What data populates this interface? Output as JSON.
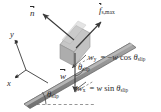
{
  "figure": {
    "name": "inclined-plane-free-body-diagram",
    "type": "physics-force-diagram",
    "background": "#ffffff"
  },
  "colors": {
    "stroke": "#3a3a3a",
    "plank_fill": "#8d8d8d",
    "plank_edge": "#6a6a6a",
    "block_fill": "#b3b3b3",
    "block_top": "#c9c9c9",
    "block_side": "#9a9a9a",
    "dashed": "#7a7a7a",
    "text": "#2b2b2b"
  },
  "labels": {
    "normal_force": {
      "symbol": "n",
      "vector": true,
      "text": "n"
    },
    "static_friction": {
      "symbol": "f",
      "sub": "s,max",
      "vector": true,
      "text": "fs,max"
    },
    "weight": {
      "symbol": "w",
      "vector": true,
      "text": "w"
    },
    "axis_y": "y",
    "axis_x": "x",
    "theta_block": "θslip",
    "theta_incline": "θslip",
    "w_y_equation": {
      "lhs": "w",
      "lhs_sub": "y",
      "rhs": "= −w cos θslip"
    },
    "w_x_equation": {
      "lhs": "w",
      "lhs_sub": "x",
      "rhs": "= w sin θslip"
    }
  },
  "equations": {
    "w_y": "w_y = -w cos(theta_slip)",
    "w_x": "w_x = w sin(theta_slip)"
  },
  "vectors": [
    {
      "name": "normal-force",
      "label": "n",
      "direction": "up-left",
      "origin": "block-center"
    },
    {
      "name": "static-friction-max",
      "label": "f_s,max",
      "direction": "up-right",
      "origin": "block-center"
    },
    {
      "name": "weight",
      "label": "w",
      "direction": "down",
      "origin": "block-center"
    },
    {
      "name": "weight-x-component",
      "label": "w_x",
      "direction": "down-incline"
    },
    {
      "name": "weight-y-component",
      "label": "w_y",
      "direction": "perpendicular-into-incline"
    }
  ],
  "angles": [
    {
      "name": "theta-slip-at-block",
      "value": "θslip"
    },
    {
      "name": "theta-slip-at-base",
      "value": "θslip"
    }
  ]
}
